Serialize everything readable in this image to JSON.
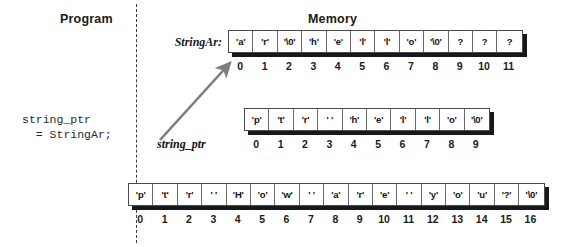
{
  "headers": {
    "program": "Program",
    "memory": "Memory"
  },
  "program": {
    "code": "string_ptr\n  = StringAr;"
  },
  "pointer": {
    "label": "string_ptr"
  },
  "arrays": [
    {
      "name": "stringar-array",
      "label": "StringAr:",
      "cells": [
        "'a'",
        "'r'",
        "'\\0'",
        "'h'",
        "'e'",
        "'l'",
        "'l'",
        "'o'",
        "'\\0'",
        "?",
        "?",
        "?"
      ],
      "indices": [
        "0",
        "1",
        "2",
        "3",
        "4",
        "5",
        "6",
        "7",
        "8",
        "9",
        "10",
        "11"
      ]
    },
    {
      "name": "ptr-hello-array",
      "label": "",
      "cells": [
        "'p'",
        "'t'",
        "'r'",
        "' '",
        "'h'",
        "'e'",
        "'l'",
        "'l'",
        "'o'",
        "'\\0'"
      ],
      "indices": [
        "0",
        "1",
        "2",
        "3",
        "4",
        "5",
        "6",
        "7",
        "8",
        "9"
      ]
    },
    {
      "name": "ptr-how-are-you-array",
      "label": "",
      "cells": [
        "'p'",
        "'t'",
        "'r'",
        "' '",
        "'H'",
        "'o'",
        "'w'",
        "' '",
        "'a'",
        "'r'",
        "'e'",
        "' '",
        "'y'",
        "'o'",
        "'u'",
        "'?'",
        "'\\0'"
      ],
      "indices": [
        "0",
        "1",
        "2",
        "3",
        "4",
        "5",
        "6",
        "7",
        "8",
        "9",
        "10",
        "11",
        "12",
        "13",
        "14",
        "15",
        "16"
      ]
    }
  ],
  "colors": {
    "ink": "#111111",
    "shadow": "#15181c",
    "arrow": "#7d7d7d",
    "divider": "#3a3a3a"
  }
}
